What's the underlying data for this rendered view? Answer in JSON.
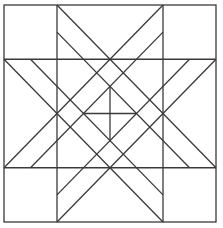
{
  "diagram": {
    "title": "",
    "stroke_color": "#3a3a3a",
    "background_color": "#ffffff",
    "units": 8,
    "outer_square": {
      "x": 4,
      "y": 5,
      "width": 212,
      "height": 217
    },
    "grid_lines": {
      "vertical": [
        2,
        6
      ],
      "horizontal": [
        2,
        6
      ]
    },
    "diagonals": [
      [
        2,
        0,
        8,
        6
      ],
      [
        6,
        0,
        0,
        6
      ],
      [
        0,
        2,
        6,
        8
      ],
      [
        8,
        2,
        2,
        8
      ],
      [
        2,
        1,
        7,
        6
      ],
      [
        6,
        1,
        1,
        6
      ],
      [
        1,
        2,
        6,
        7
      ],
      [
        7,
        2,
        2,
        7
      ]
    ],
    "center_cross": [
      [
        3,
        4,
        5,
        4
      ],
      [
        4,
        3,
        4,
        5
      ]
    ]
  }
}
